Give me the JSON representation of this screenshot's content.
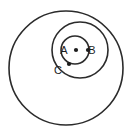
{
  "figure": {
    "background_color": "#ffffff",
    "stroke_color": "#2b2b2b",
    "label_color": "#1c1c1c",
    "width": 132,
    "height": 135
  },
  "circles": [
    {
      "id": "outer-circle",
      "name": "large-outer-circle",
      "cx": 66,
      "cy": 68,
      "r": 57,
      "stroke_width": 1.6
    },
    {
      "id": "middle-circle",
      "name": "medium-inner-circle",
      "cx": 80,
      "cy": 50,
      "r": 28,
      "stroke_width": 1.6
    },
    {
      "id": "small-circle",
      "name": "small-circle-centered-at-A",
      "cx": 75,
      "cy": 50,
      "r": 14,
      "stroke_width": 1.6
    }
  ],
  "points": [
    {
      "id": "A",
      "label": "A",
      "dot_cx": 76,
      "dot_cy": 50,
      "dot_r": 2.1,
      "label_x": 64,
      "label_y": 54,
      "description": "center point of the small circle"
    },
    {
      "id": "B",
      "label": "B",
      "dot_cx": 88,
      "dot_cy": 50,
      "dot_r": 2.1,
      "label_x": 92,
      "label_y": 54,
      "description": "point on the right edge of the small circle"
    },
    {
      "id": "C",
      "label": "C",
      "dot_cx": 69,
      "dot_cy": 64,
      "dot_r": 2.1,
      "label_x": 58,
      "label_y": 74,
      "description": "point at lower-left where the small and medium circles meet"
    }
  ]
}
